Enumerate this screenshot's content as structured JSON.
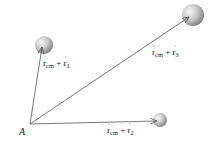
{
  "diagram": {
    "origin": {
      "label": "A",
      "x": 30,
      "y": 124
    },
    "particles": [
      {
        "id": "1",
        "cx": 44,
        "cy": 45,
        "r": 9,
        "label_main": "r",
        "label_sub_main": "cm",
        "label_plus": "+",
        "label_vec": "r",
        "label_sub": "1"
      },
      {
        "id": "2",
        "cx": 160,
        "cy": 120,
        "r": 7,
        "label_main": "r",
        "label_sub_main": "cm",
        "label_plus": "+",
        "label_vec": "r",
        "label_sub": "2"
      },
      {
        "id": "3",
        "cx": 193,
        "cy": 15,
        "r": 11,
        "label_main": "r",
        "label_sub_main": "cm",
        "label_plus": "+",
        "label_vec": "r",
        "label_sub": "3"
      }
    ],
    "colors": {
      "line": "#555555",
      "sphere_light": "#f4f4f4",
      "sphere_dark": "#8a8a8a",
      "text": "#222222"
    }
  }
}
